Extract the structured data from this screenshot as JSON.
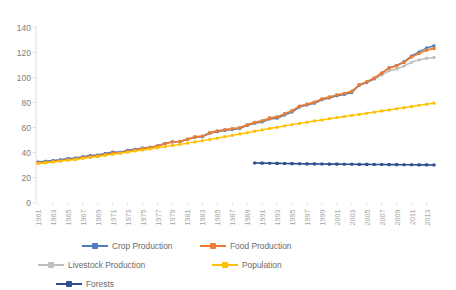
{
  "chart_data": {
    "type": "line",
    "title": "",
    "subtitle": "",
    "xlabel": "",
    "ylabel": "",
    "ylim": [
      0,
      140
    ],
    "y_ticks": [
      0,
      20,
      40,
      60,
      80,
      100,
      120,
      140
    ],
    "grid": false,
    "legend_position": "bottom",
    "x": [
      1961,
      1962,
      1963,
      1964,
      1965,
      1966,
      1967,
      1968,
      1969,
      1970,
      1971,
      1972,
      1973,
      1974,
      1975,
      1976,
      1977,
      1978,
      1979,
      1980,
      1981,
      1982,
      1983,
      1984,
      1985,
      1986,
      1987,
      1988,
      1989,
      1990,
      1991,
      1992,
      1993,
      1994,
      1995,
      1996,
      1997,
      1998,
      1999,
      2000,
      2001,
      2002,
      2003,
      2004,
      2005,
      2006,
      2007,
      2008,
      2009,
      2010,
      2011,
      2012,
      2013,
      2014
    ],
    "x_tick_labels": [
      "1961",
      "1963",
      "1965",
      "1967",
      "1969",
      "1971",
      "1973",
      "1975",
      "1977",
      "1979",
      "1981",
      "1983",
      "1985",
      "1987",
      "1989",
      "1991",
      "1993",
      "1995",
      "1997",
      "1999",
      "2001",
      "2003",
      "2005",
      "2007",
      "2009",
      "2011",
      "2013"
    ],
    "series": [
      {
        "name": "Crop Production",
        "color": "#4f7cbf",
        "values": [
          32.5,
          33.0,
          33.6,
          34.3,
          35.2,
          35.6,
          36.7,
          37.6,
          38.0,
          39.2,
          40.4,
          40.3,
          41.8,
          42.6,
          43.6,
          44.3,
          45.3,
          47.3,
          48.5,
          48.6,
          50.4,
          52.1,
          52.6,
          55.4,
          56.6,
          57.5,
          58.3,
          59.2,
          61.5,
          63.4,
          64.4,
          66.8,
          67.4,
          70.0,
          72.3,
          76.3,
          78.0,
          79.4,
          82.2,
          83.6,
          85.3,
          86.4,
          88.0,
          93.8,
          96.2,
          99.2,
          103.4,
          107.8,
          109.6,
          112.6,
          117.3,
          120.5,
          123.6,
          125.4
        ]
      },
      {
        "name": "Food Production",
        "color": "#ed7d31",
        "values": [
          31.6,
          32.2,
          32.8,
          33.4,
          34.2,
          34.7,
          35.9,
          36.7,
          37.3,
          38.4,
          39.5,
          39.6,
          41.0,
          42.0,
          43.2,
          44.0,
          45.1,
          47.0,
          48.4,
          48.8,
          50.6,
          52.5,
          53.0,
          55.7,
          57.1,
          58.2,
          59.0,
          59.8,
          62.1,
          64.0,
          65.2,
          67.5,
          68.3,
          70.9,
          73.3,
          77.0,
          78.6,
          80.1,
          82.8,
          84.3,
          86.0,
          87.2,
          88.9,
          94.2,
          96.6,
          99.6,
          103.6,
          107.6,
          109.3,
          112.1,
          116.4,
          119.2,
          121.9,
          123.3
        ]
      },
      {
        "name": "Livestock Production",
        "color": "#bfbfbf",
        "values": [
          32.0,
          32.6,
          33.3,
          34.0,
          34.8,
          35.3,
          36.4,
          37.2,
          37.8,
          38.9,
          40.0,
          40.1,
          41.5,
          42.4,
          43.5,
          44.3,
          45.4,
          47.2,
          48.6,
          49.0,
          50.8,
          52.7,
          53.3,
          56.0,
          57.4,
          58.5,
          59.3,
          60.1,
          62.4,
          64.3,
          65.6,
          67.9,
          68.6,
          71.2,
          73.6,
          77.3,
          78.9,
          80.4,
          83.0,
          84.5,
          86.2,
          87.4,
          89.0,
          94.0,
          96.0,
          98.6,
          102.0,
          105.4,
          106.8,
          109.2,
          112.3,
          114.0,
          115.4,
          116.0
        ]
      },
      {
        "name": "Population",
        "color": "#ffc000",
        "values": [
          31.2,
          31.8,
          32.4,
          33.1,
          33.8,
          34.5,
          35.3,
          36.1,
          36.9,
          37.7,
          38.6,
          39.4,
          40.3,
          41.2,
          42.0,
          42.9,
          43.8,
          44.7,
          45.6,
          46.5,
          47.5,
          48.5,
          49.5,
          50.5,
          51.5,
          52.6,
          53.7,
          54.8,
          55.9,
          57.0,
          58.1,
          59.2,
          60.2,
          61.3,
          62.3,
          63.3,
          64.3,
          65.2,
          66.1,
          67.0,
          67.9,
          68.8,
          69.7,
          70.5,
          71.4,
          72.3,
          73.2,
          74.1,
          75.0,
          75.9,
          76.8,
          77.7,
          78.6,
          79.5
        ]
      },
      {
        "name": "Forests",
        "color": "#2f4f8f",
        "start_year": 1990,
        "values_from_1990": [
          31.6,
          31.5,
          31.4,
          31.3,
          31.2,
          31.1,
          31.0,
          30.9,
          30.9,
          30.8,
          30.7,
          30.7,
          30.6,
          30.6,
          30.5,
          30.5,
          30.4,
          30.4,
          30.3,
          30.3,
          30.2,
          30.2,
          30.1,
          30.1,
          30.0
        ]
      }
    ],
    "legend": [
      {
        "label": "Crop Production",
        "color": "#4f7cbf",
        "marker_color": "#4f7cbf"
      },
      {
        "label": "Food Production",
        "color": "#ed7d31",
        "marker_color": "#ed7d31"
      },
      {
        "label": "Livestock Production",
        "color": "#bfbfbf",
        "marker_color": "#bfbfbf"
      },
      {
        "label": "Population",
        "color": "#ffc000",
        "marker_color": "#ffc000"
      },
      {
        "label": "Forests",
        "color": "#2f4f8f",
        "marker_color": "#2f4f8f"
      }
    ]
  },
  "colors": {
    "axis_text": "#808080",
    "tick_text": "#a6a6a6",
    "axis_line": "#d9d9d9",
    "background": "#ffffff",
    "legend_text": "#6b6b6b"
  }
}
